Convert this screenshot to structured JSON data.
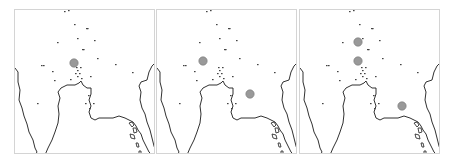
{
  "figure": {
    "type": "map-small-multiples",
    "panel_count": 3,
    "colors": {
      "background": "#ffffff",
      "panel_border": "#d4d4d4",
      "coastline": "#1a1a1a",
      "minor_points": "#444444",
      "highlight_marker": "#999999"
    }
  },
  "panels": [
    {
      "id": "panel-1",
      "left": 14,
      "markers": [
        {
          "cx": 59,
          "cy": 53,
          "r": 4.2
        }
      ]
    },
    {
      "id": "panel-2",
      "left": 156,
      "markers": [
        {
          "cx": 46,
          "cy": 51,
          "r": 4.2
        },
        {
          "cx": 93,
          "cy": 84,
          "r": 4.2
        }
      ]
    },
    {
      "id": "panel-3",
      "left": 299,
      "markers": [
        {
          "cx": 58,
          "cy": 32,
          "r": 4.2
        },
        {
          "cx": 58,
          "cy": 51,
          "r": 4.2
        },
        {
          "cx": 102,
          "cy": 96,
          "r": 4.2
        }
      ]
    }
  ],
  "minor_points": [
    [
      49,
      1
    ],
    [
      53,
      0
    ],
    [
      59,
      14
    ],
    [
      71,
      18
    ],
    [
      72,
      18
    ],
    [
      42,
      32
    ],
    [
      62,
      28
    ],
    [
      79,
      30
    ],
    [
      67,
      39
    ],
    [
      68,
      39
    ],
    [
      82,
      48
    ],
    [
      100,
      54
    ],
    [
      117,
      62
    ],
    [
      61,
      57
    ],
    [
      65,
      57
    ],
    [
      62,
      60
    ],
    [
      60,
      63
    ],
    [
      64,
      63
    ],
    [
      62,
      66
    ],
    [
      66,
      68
    ],
    [
      75,
      66
    ],
    [
      37,
      61
    ],
    [
      26,
      55
    ],
    [
      28,
      55
    ],
    [
      39,
      70
    ],
    [
      55,
      69
    ],
    [
      22,
      93
    ],
    [
      73,
      85
    ],
    [
      70,
      93
    ],
    [
      78,
      93
    ],
    [
      74,
      98
    ]
  ]
}
